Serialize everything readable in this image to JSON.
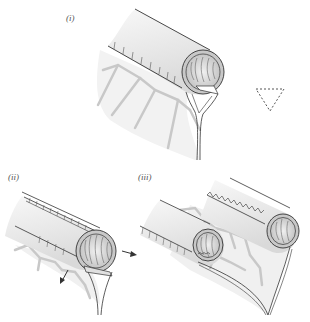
{
  "panels": [
    {
      "id": "i",
      "label": "(i)"
    },
    {
      "id": "ii",
      "label": "(ii)"
    },
    {
      "id": "iii",
      "label": "(iii)"
    }
  ],
  "colors": {
    "outline": "#333333",
    "tube_fill": "#ebebeb",
    "tube_light": "#f7f7f7",
    "vessel": "#c8c8c8",
    "mesentery": "#f1f1f1",
    "inner": "#d4d4d4"
  },
  "symbols": {
    "dashed_triangle": "dashed-triangle",
    "arrow": "arrow"
  }
}
